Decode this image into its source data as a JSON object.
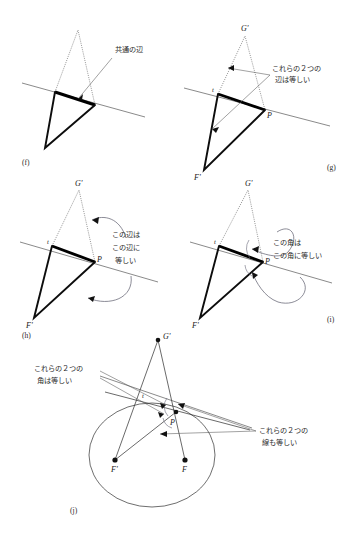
{
  "figure": {
    "type": "geometry-construction-diagram",
    "background_color": "#ffffff",
    "ink_color": "#1a1a1a"
  },
  "panels": [
    {
      "id": "f",
      "label": "(f)",
      "annotations": [
        {
          "id": "f-note",
          "lines": [
            "共通の辺"
          ]
        }
      ],
      "point_labels": []
    },
    {
      "id": "g",
      "label": "(g)",
      "annotations": [
        {
          "id": "g-note",
          "lines": [
            "これらの２つの",
            "辺は等しい"
          ]
        }
      ],
      "point_labels": [
        {
          "name": "g-label-gprime",
          "text": "G'"
        },
        {
          "name": "g-label-t",
          "text": "t"
        },
        {
          "name": "g-label-p",
          "text": "P"
        },
        {
          "name": "g-label-fprime",
          "text": "F'"
        }
      ]
    },
    {
      "id": "h",
      "label": "(h)",
      "annotations": [
        {
          "id": "h-note",
          "lines": [
            "この辺は",
            "この辺に",
            "等しい"
          ]
        }
      ],
      "point_labels": [
        {
          "name": "h-label-gprime",
          "text": "G'"
        },
        {
          "name": "h-label-t",
          "text": "t"
        },
        {
          "name": "h-label-p",
          "text": "P"
        },
        {
          "name": "h-label-fprime",
          "text": "F'"
        }
      ]
    },
    {
      "id": "i",
      "label": "(i)",
      "annotations": [
        {
          "id": "i-note",
          "lines": [
            "この角は",
            "この角に等しい"
          ]
        }
      ],
      "point_labels": [
        {
          "name": "i-label-gprime",
          "text": "G'"
        },
        {
          "name": "i-label-t",
          "text": "t"
        },
        {
          "name": "i-label-p",
          "text": "P"
        },
        {
          "name": "i-label-fprime",
          "text": "F'"
        }
      ]
    },
    {
      "id": "j",
      "label": "(j)",
      "annotations": [
        {
          "id": "j-note-left",
          "lines": [
            "これらの２つの",
            "角は等しい"
          ]
        },
        {
          "id": "j-note-right",
          "lines": [
            "これらの２つの",
            "線も等しい"
          ]
        }
      ],
      "point_labels": [
        {
          "name": "j-label-gprime",
          "text": "G'"
        },
        {
          "name": "j-label-t",
          "text": "t"
        },
        {
          "name": "j-label-p",
          "text": "P"
        },
        {
          "name": "j-label-fprime",
          "text": "F'"
        },
        {
          "name": "j-label-f",
          "text": "F"
        }
      ]
    }
  ],
  "text": {
    "panel_f_label": "(f)",
    "panel_g_label": "(g)",
    "panel_h_label": "(h)",
    "panel_i_label": "(i)",
    "panel_j_label": "(j)",
    "f_note_l1": "共通の辺",
    "g_note_l1": "これらの２つの",
    "g_note_l2": "辺は等しい",
    "h_note_l1": "この辺は",
    "h_note_l2": "この辺に",
    "h_note_l3": "等しい",
    "i_note_l1": "この角は",
    "i_note_l2": "この角に等しい",
    "j_note_left_l1": "これらの２つの",
    "j_note_left_l2": "角は等しい",
    "j_note_right_l1": "これらの２つの",
    "j_note_right_l2": "線も等しい",
    "label_gprime": "G'",
    "label_fprime": "F'",
    "label_f": "F",
    "label_p": "P",
    "label_t": "t"
  }
}
